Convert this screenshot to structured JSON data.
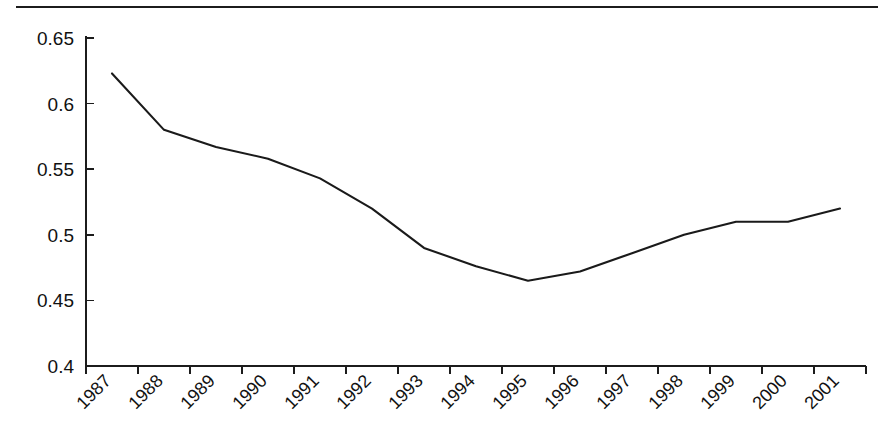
{
  "chart_data": {
    "type": "line",
    "title": "",
    "subtitle": "",
    "xlabel": "",
    "ylabel": "",
    "categories": [
      "1987",
      "1988",
      "1989",
      "1990",
      "1991",
      "1992",
      "1993",
      "1994",
      "1995",
      "1996",
      "1997",
      "1998",
      "1999",
      "2000",
      "2001"
    ],
    "values": [
      0.623,
      0.58,
      0.567,
      0.558,
      0.543,
      0.52,
      0.49,
      0.476,
      0.465,
      0.472,
      0.486,
      0.5,
      0.51,
      0.51,
      0.52
    ],
    "series": [
      {
        "name": "series-1",
        "values": [
          0.623,
          0.58,
          0.567,
          0.558,
          0.543,
          0.52,
          0.49,
          0.476,
          0.465,
          0.472,
          0.486,
          0.5,
          0.51,
          0.51,
          0.52
        ]
      }
    ],
    "ylim": [
      0.4,
      0.65
    ],
    "xlim": [
      0,
      15
    ],
    "ytick_labels": [
      "0.65",
      "0.6",
      "0.55",
      "0.5",
      "0.45",
      "0.4"
    ],
    "ytick_values": [
      0.65,
      0.6,
      0.55,
      0.5,
      0.45,
      0.4
    ],
    "xtick_labels": [
      "1987",
      "1988",
      "1989",
      "1990",
      "1991",
      "1992",
      "1993",
      "1994",
      "1995",
      "1996",
      "1997",
      "1998",
      "1999",
      "2000",
      "2001"
    ],
    "grid": false,
    "legend": false,
    "legend_position": "none",
    "xtick_label_rotation": 45,
    "line_color": "#1a1a1a",
    "background_color": "#ffffff",
    "annotations": []
  },
  "figure": {
    "top_rule": "horizontal-divider-rule"
  }
}
